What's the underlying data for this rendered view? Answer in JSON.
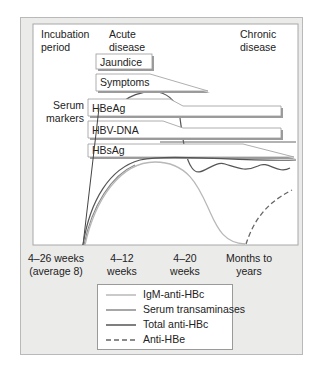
{
  "phases": {
    "incubation": [
      "Incubation",
      "period"
    ],
    "acute": [
      "Acute",
      "disease"
    ],
    "chronic": [
      "Chronic",
      "disease"
    ]
  },
  "clinical_boxes": {
    "jaundice": "Jaundice",
    "symptoms": "Symptoms"
  },
  "serum_markers_label": [
    "Serum",
    "markers"
  ],
  "markers": {
    "hbeag": "HBeAg",
    "hbvdna": "HBV-DNA",
    "hbsag": "HBsAg"
  },
  "timeline": [
    [
      "4–26 weeks",
      "(average 8)"
    ],
    [
      "4–12",
      "weeks"
    ],
    [
      "4–20",
      "weeks"
    ],
    [
      "Months to",
      "years"
    ]
  ],
  "legend": [
    {
      "label": "IgM-anti-HBc",
      "style": "solid",
      "color": "#b8b8b8"
    },
    {
      "label": "Serum transaminases",
      "style": "solid",
      "color": "#8a8a8a"
    },
    {
      "label": "Total anti-HBc",
      "style": "solid",
      "color": "#555555"
    },
    {
      "label": "Anti-HBe",
      "style": "dashed",
      "color": "#666666"
    }
  ],
  "colors": {
    "frame_bg": "#ebebea",
    "chart_bg": "#ffffff",
    "box_fill": "#ffffff",
    "box_shadow": "#9c9c9c"
  }
}
